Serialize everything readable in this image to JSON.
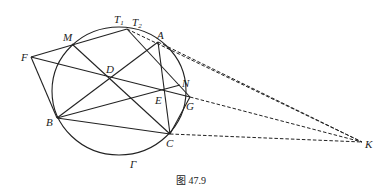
{
  "figure": {
    "caption": "图 47.9",
    "circle_label": "Γ",
    "points": {
      "A": {
        "label": "A",
        "x": 158,
        "y": 42
      },
      "B": {
        "label": "B",
        "x": 57,
        "y": 118
      },
      "C": {
        "label": "C",
        "x": 170,
        "y": 134
      },
      "D": {
        "label": "D",
        "x": 110,
        "y": 78
      },
      "E": {
        "label": "E",
        "x": 163,
        "y": 91
      },
      "F": {
        "label": "F",
        "x": 31,
        "y": 57
      },
      "G": {
        "label": "G",
        "x": 190,
        "y": 97
      },
      "K": {
        "label": "K",
        "x": 362,
        "y": 142
      },
      "M": {
        "label": "M",
        "x": 72,
        "y": 44
      },
      "N": {
        "label": "N",
        "x": 180,
        "y": 85
      },
      "T": {
        "label_1": "T",
        "sub_1": "1",
        "label_2": "T",
        "sub_2": "2",
        "x": 127,
        "y": 29
      }
    },
    "solid_segments": [
      "F-T",
      "F-B",
      "F-G",
      "M-C",
      "B-A",
      "B-N",
      "B-C",
      "A-C",
      "T-G",
      "C-G"
    ],
    "dashed_segments": [
      "T-K",
      "A-K",
      "G-K",
      "C-K"
    ]
  }
}
